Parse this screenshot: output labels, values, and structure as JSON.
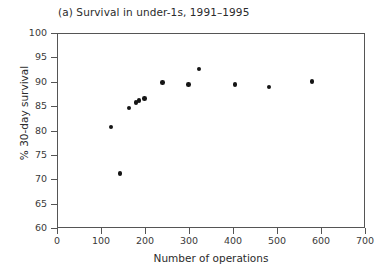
{
  "chart_data": {
    "type": "scatter",
    "title": "(a) Survival in under-1s, 1991–1995",
    "xlabel": "Number of operations",
    "ylabel": "% 30-day survival",
    "xlim": [
      0,
      700
    ],
    "ylim": [
      60,
      100
    ],
    "xticks": [
      0,
      100,
      200,
      300,
      400,
      500,
      600,
      700
    ],
    "yticks": [
      60,
      65,
      70,
      75,
      80,
      85,
      90,
      95,
      100
    ],
    "xticklabels": [
      "0",
      "100",
      "200",
      "300",
      "400",
      "500",
      "600",
      "700"
    ],
    "yticklabels": [
      "60",
      "65",
      "70",
      "75",
      "80",
      "85",
      "90",
      "95",
      "100"
    ],
    "grid": false,
    "legend": false,
    "marker": "filled-circle",
    "marker_color": "#151515",
    "frame_color": "#555555",
    "background": "#ffffff",
    "points": [
      {
        "x": 120,
        "y": 80.9
      },
      {
        "x": 141,
        "y": 71.4
      },
      {
        "x": 161,
        "y": 84.8
      },
      {
        "x": 177,
        "y": 86.0
      },
      {
        "x": 184,
        "y": 86.4
      },
      {
        "x": 197,
        "y": 86.8
      },
      {
        "x": 238,
        "y": 90.1
      },
      {
        "x": 297,
        "y": 89.7
      },
      {
        "x": 320,
        "y": 92.8
      },
      {
        "x": 402,
        "y": 89.7
      },
      {
        "x": 480,
        "y": 89.1
      },
      {
        "x": 577,
        "y": 90.3
      }
    ]
  }
}
